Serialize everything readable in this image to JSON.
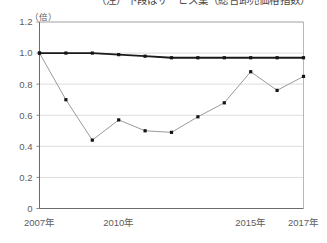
{
  "title": {
    "text": "（注）下段はサービス業（総合卸売価格指数）",
    "clipped": true
  },
  "chart_data": {
    "type": "line",
    "title": "（注）下段はサービス業（総合卸売価格指数）",
    "xlabel": "",
    "ylabel": "（倍）",
    "unit_label": "（倍）",
    "x": [
      2007,
      2008,
      2009,
      2010,
      2011,
      2012,
      2013,
      2014,
      2015,
      2016,
      2017
    ],
    "categories": [
      "2007年",
      "2008",
      "2009",
      "2010年",
      "2011",
      "2012",
      "2013",
      "2014",
      "2015年",
      "2016",
      "2017年"
    ],
    "xtick_labels": [
      "2007年",
      "2010年",
      "2015年",
      "2017年"
    ],
    "xtick_values": [
      2007,
      2010,
      2015,
      2017
    ],
    "ytick_labels": [
      "0",
      "0.2",
      "0.4",
      "0.6",
      "0.8",
      "1.0",
      "1.2"
    ],
    "ytick_values": [
      0,
      0.2,
      0.4,
      0.6,
      0.8,
      1.0,
      1.2
    ],
    "ylim": [
      0,
      1.2
    ],
    "xlim": [
      2007,
      2017
    ],
    "grid": true,
    "grid_axis": "y",
    "legend": "none",
    "series": [
      {
        "name": "series-dark",
        "color": "#1a1a1a",
        "line_width": 1.8,
        "marker": "square",
        "values": [
          1.0,
          1.0,
          1.0,
          0.99,
          0.98,
          0.97,
          0.97,
          0.97,
          0.97,
          0.97,
          0.97
        ]
      },
      {
        "name": "series-gray",
        "color": "#9a9a9a",
        "line_width": 1.0,
        "marker": "square",
        "values": [
          1.0,
          0.7,
          0.44,
          0.57,
          0.5,
          0.49,
          0.59,
          0.68,
          0.88,
          0.76,
          0.85
        ]
      }
    ]
  },
  "axis": {
    "origin_label": "0"
  }
}
